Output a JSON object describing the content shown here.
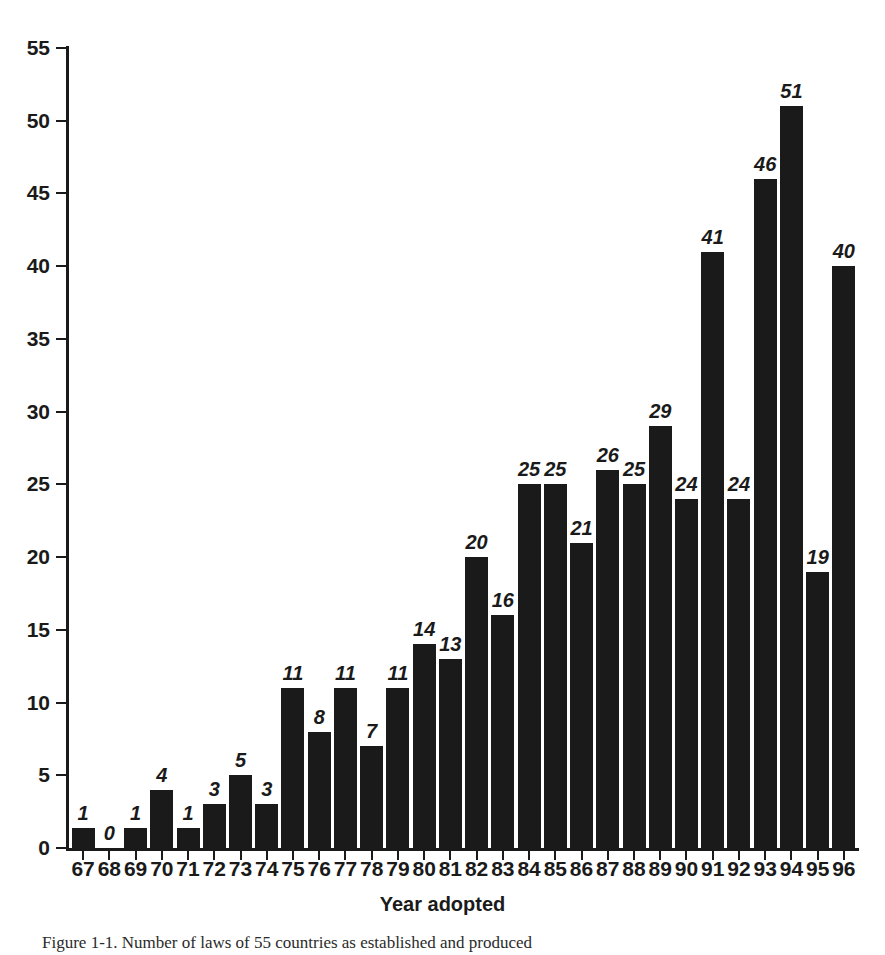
{
  "chart_data": {
    "type": "bar",
    "title": "",
    "xlabel": "Year adopted",
    "ylabel": "",
    "categories": [
      "67",
      "68",
      "69",
      "70",
      "71",
      "72",
      "73",
      "74",
      "75",
      "76",
      "77",
      "78",
      "79",
      "80",
      "81",
      "82",
      "83",
      "84",
      "85",
      "86",
      "87",
      "88",
      "89",
      "90",
      "91",
      "92",
      "93",
      "94",
      "95",
      "96"
    ],
    "values": [
      1,
      0,
      1,
      4,
      1,
      3,
      5,
      3,
      11,
      8,
      11,
      7,
      11,
      14,
      13,
      20,
      16,
      25,
      25,
      21,
      26,
      25,
      29,
      24,
      41,
      24,
      46,
      51,
      19,
      40
    ],
    "ylim": [
      0,
      55
    ],
    "y_ticks": [
      0,
      5,
      10,
      15,
      20,
      25,
      30,
      35,
      40,
      45,
      50,
      55
    ],
    "y_tick_labels": [
      "0",
      "5",
      "10",
      "15",
      "20",
      "25",
      "30",
      "35",
      "40",
      "45",
      "50",
      "55"
    ],
    "grid": false,
    "legend": null,
    "bar_color": "#1a1a1a",
    "value_labels_shown": true
  },
  "caption": {
    "text": "Figure 1-1. Number of laws of 55 countries as established and produced"
  },
  "axis": {
    "x_title": "Year adopted"
  }
}
